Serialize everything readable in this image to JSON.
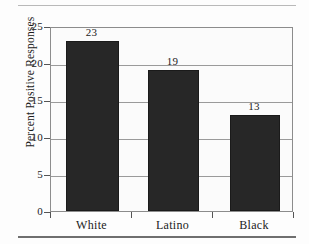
{
  "chart_data": {
    "type": "bar",
    "title": "",
    "subtitle": "",
    "xlabel": "",
    "ylabel": "Percent Positive Responses",
    "categories": [
      "White",
      "Latino",
      "Black"
    ],
    "values": [
      23,
      19,
      13
    ],
    "value_labels": [
      "23",
      "19",
      "13"
    ],
    "ylim": [
      0,
      25
    ],
    "ytick_labels": [
      "0",
      "5",
      "10",
      "15",
      "20",
      "25"
    ],
    "ytick_values": [
      0,
      5,
      10,
      15,
      20,
      25
    ],
    "gridlines": [
      5,
      10,
      15,
      20
    ],
    "grid": true,
    "legend": null,
    "legend_position": "none",
    "bar_color": "#272727",
    "plot_background": "#fbfbfb",
    "frame_color": "#8c8c8c",
    "grid_color": "#9a9a9a",
    "text_color": "#1b1b1b"
  },
  "decor": {
    "top_rule_color": "#b9b9b9",
    "bottom_rule_color": "#6f6f6f"
  }
}
